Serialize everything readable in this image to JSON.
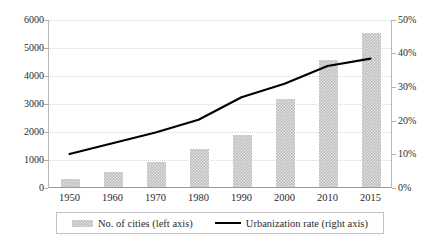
{
  "chart_data": {
    "type": "bar",
    "title": "",
    "subtitle": "",
    "xlabel": "",
    "ylabel": "",
    "categories": [
      "1950",
      "1960",
      "1970",
      "1980",
      "1990",
      "2000",
      "2010",
      "2015"
    ],
    "series": [
      {
        "name": "No. of cities (left axis)",
        "type": "bar",
        "axis": "left",
        "color": "#bfbfbf",
        "values": [
          280,
          530,
          900,
          1360,
          1850,
          3150,
          4550,
          5500
        ]
      },
      {
        "name": "Urbanization rate (right axis)",
        "type": "line",
        "axis": "right",
        "color": "#000000",
        "values": [
          10.1,
          13.3,
          16.5,
          20.3,
          27.0,
          31.0,
          36.3,
          38.5
        ]
      }
    ],
    "left_axis": {
      "ticks": [
        "0",
        "1000",
        "2000",
        "3000",
        "4000",
        "5000",
        "6000"
      ],
      "values": [
        0,
        1000,
        2000,
        3000,
        4000,
        5000,
        6000
      ],
      "ylim": [
        0,
        6000
      ]
    },
    "right_axis": {
      "ticks": [
        "0%",
        "10%",
        "20%",
        "30%",
        "40%",
        "50%"
      ],
      "values": [
        0,
        10,
        20,
        30,
        40,
        50
      ],
      "ylim": [
        0,
        50
      ]
    },
    "grid": true,
    "legend_position": "bottom"
  },
  "legend": {
    "bars_label": "No. of cities (left axis)",
    "line_label": "Urbanization rate (right axis)"
  }
}
